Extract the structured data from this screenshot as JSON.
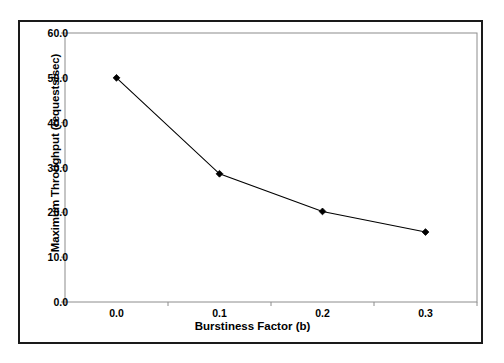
{
  "chart_data": {
    "type": "line",
    "title": "",
    "subtitle": "",
    "xlabel": "Burstiness Factor (b)",
    "ylabel": "Maximum Throughput (requests/sec)",
    "x": [
      0.0,
      0.1,
      0.2,
      0.3
    ],
    "categories": [
      "0.0",
      "0.1",
      "0.2",
      "0.3"
    ],
    "values": [
      50.0,
      28.6,
      20.2,
      15.6
    ],
    "series": [
      {
        "name": "Maximum Throughput",
        "values": [
          50.0,
          28.6,
          20.2,
          15.6
        ],
        "marker": "diamond",
        "color": "#000000"
      }
    ],
    "xtick_labels": [
      "0.0",
      "0.1",
      "0.2",
      "0.3"
    ],
    "ytick_labels": [
      "0.0",
      "10.0",
      "20.0",
      "30.0",
      "40.0",
      "50.0",
      "60.0"
    ],
    "ytick_values": [
      0.0,
      10.0,
      20.0,
      30.0,
      40.0,
      50.0,
      60.0
    ],
    "ylim": [
      0.0,
      60.0
    ],
    "grid": false,
    "legend": false,
    "legend_position": "none",
    "annotations": []
  },
  "colors": {
    "line": "#000000",
    "marker": "#000000",
    "plot_border": "#8c8c8c",
    "outer_frame": "#1a1a1a",
    "background": "#ffffff",
    "text": "#000000",
    "tick": "#8c8c8c"
  }
}
